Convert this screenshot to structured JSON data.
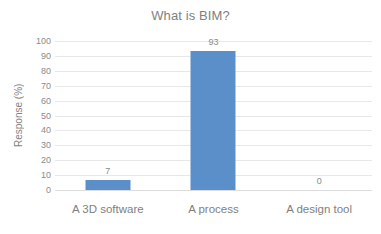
{
  "chart_data": {
    "type": "bar",
    "title": "What is BIM?",
    "xlabel": "",
    "ylabel": "Response (%)",
    "categories": [
      "A 3D software",
      "A process",
      "A design tool"
    ],
    "values": [
      7,
      93,
      0
    ],
    "value_labels": [
      "7",
      "93",
      "0"
    ],
    "ylim": [
      0,
      100
    ],
    "yticks": [
      100,
      90,
      80,
      70,
      60,
      50,
      40,
      30,
      20,
      10,
      0
    ],
    "ytick_labels": [
      "100",
      "90",
      "80",
      "70",
      "60",
      "50",
      "40",
      "30",
      "20",
      "10",
      "0"
    ],
    "grid": true,
    "legend": false,
    "legend_position": "none",
    "series": [
      {
        "name": "Response (%)",
        "values": [
          7,
          93,
          0
        ]
      }
    ],
    "colors": {
      "bar": "#5b8fc9",
      "gridline": "#e8e8e8",
      "text": "#7f7f7f",
      "tick_text": "#8a8a8a",
      "background": "#ffffff"
    }
  }
}
